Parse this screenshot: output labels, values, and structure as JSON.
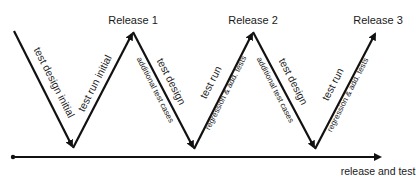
{
  "releases": [
    {
      "label": "Release 1"
    },
    {
      "label": "Release 2"
    },
    {
      "label": "Release 3"
    }
  ],
  "segments": [
    {
      "main": "test design initial",
      "sub": ""
    },
    {
      "main": "test run initial",
      "sub": ""
    },
    {
      "main": "test design",
      "sub": "additional test cases"
    },
    {
      "main": "test run",
      "sub": "regression & add. tests"
    },
    {
      "main": "test design",
      "sub": "additional test cases"
    },
    {
      "main": "test run",
      "sub": "regression & add. tests"
    }
  ],
  "timeline": {
    "label": "release and test"
  },
  "colors": {
    "line": "#111111",
    "text": "#1a1a1a",
    "background": "#ffffff"
  }
}
